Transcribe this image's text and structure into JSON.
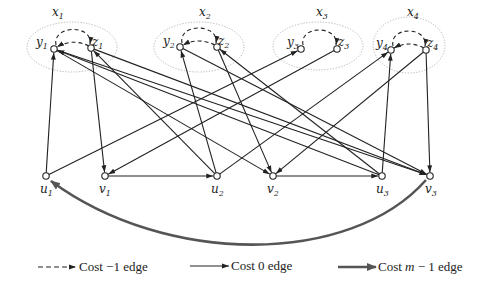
{
  "diagram": {
    "groups": [
      {
        "id": "x1",
        "label": "x",
        "sub": "1",
        "cx": 72,
        "cy": 47,
        "rx": 45,
        "ry": 25,
        "lx": 52,
        "ly": 16
      },
      {
        "id": "x2",
        "label": "x",
        "sub": "2",
        "cx": 199,
        "cy": 47,
        "rx": 45,
        "ry": 25,
        "lx": 199,
        "ly": 16
      },
      {
        "id": "x3",
        "label": "x",
        "sub": "3",
        "cx": 318,
        "cy": 46,
        "rx": 45,
        "ry": 24,
        "lx": 316,
        "ly": 16
      },
      {
        "id": "x4",
        "label": "x",
        "sub": "4",
        "cx": 409,
        "cy": 45,
        "rx": 36,
        "ry": 28,
        "lx": 407,
        "ly": 16
      }
    ],
    "nodes": [
      {
        "id": "y1",
        "label": "y",
        "sub": "1",
        "x": 54,
        "y": 49,
        "lx": 36,
        "ly": 46
      },
      {
        "id": "z1",
        "label": "z",
        "sub": "1",
        "x": 91,
        "y": 48,
        "lx": 92,
        "ly": 46
      },
      {
        "id": "y2",
        "label": "y",
        "sub": "2",
        "x": 180,
        "y": 47,
        "lx": 163,
        "ly": 45
      },
      {
        "id": "z2",
        "label": "z",
        "sub": "2",
        "x": 217,
        "y": 47,
        "lx": 218,
        "ly": 45
      },
      {
        "id": "y3",
        "label": "y",
        "sub": "3",
        "x": 301,
        "y": 49,
        "lx": 287,
        "ly": 46
      },
      {
        "id": "z3",
        "label": "z",
        "sub": "3",
        "x": 337,
        "y": 49,
        "lx": 338,
        "ly": 46
      },
      {
        "id": "y4",
        "label": "y",
        "sub": "4",
        "x": 391,
        "y": 50,
        "lx": 376,
        "ly": 47
      },
      {
        "id": "z4",
        "label": "z",
        "sub": "4",
        "x": 426,
        "y": 50,
        "lx": 427,
        "ly": 47
      },
      {
        "id": "u1",
        "label": "u",
        "sub": "1",
        "x": 46,
        "y": 176,
        "lx": 40,
        "ly": 193
      },
      {
        "id": "v1",
        "label": "v",
        "sub": "1",
        "x": 105,
        "y": 176,
        "lx": 99,
        "ly": 193
      },
      {
        "id": "u2",
        "label": "u",
        "sub": "2",
        "x": 217,
        "y": 176,
        "lx": 211,
        "ly": 193
      },
      {
        "id": "v2",
        "label": "v",
        "sub": "2",
        "x": 273,
        "y": 176,
        "lx": 267,
        "ly": 193
      },
      {
        "id": "u3",
        "label": "u",
        "sub": "3",
        "x": 382,
        "y": 176,
        "lx": 376,
        "ly": 193
      },
      {
        "id": "v3",
        "label": "v",
        "sub": "3",
        "x": 430,
        "y": 176,
        "lx": 425,
        "ly": 193
      }
    ],
    "edges_cost_0": [
      [
        "u1",
        "y1"
      ],
      [
        "u1",
        "y3"
      ],
      [
        "z1",
        "v1"
      ],
      [
        "v1",
        "u2"
      ],
      [
        "u2",
        "y2"
      ],
      [
        "u2",
        "z1"
      ],
      [
        "u2",
        "y4"
      ],
      [
        "z2",
        "v2"
      ],
      [
        "v2",
        "u3"
      ],
      [
        "u3",
        "y4"
      ],
      [
        "u3",
        "y1"
      ],
      [
        "u3",
        "z2"
      ],
      [
        "z4",
        "v3"
      ],
      [
        "z4",
        "v2"
      ],
      [
        "z3",
        "v1"
      ],
      [
        "y1",
        "v3"
      ],
      [
        "z1",
        "v3"
      ],
      [
        "y2",
        "v3"
      ],
      [
        "y1",
        "v2"
      ]
    ],
    "edges_cost_neg1": [
      [
        "y1",
        "z1",
        "upper"
      ],
      [
        "z1",
        "y1",
        "lower"
      ],
      [
        "y2",
        "z2",
        "upper"
      ],
      [
        "z2",
        "y2",
        "lower"
      ],
      [
        "y3",
        "z3",
        "upper"
      ],
      [
        "y4",
        "z4",
        "upper"
      ],
      [
        "z4",
        "y4",
        "lower"
      ]
    ],
    "edges_cost_m1": [
      [
        "v3",
        "u1"
      ]
    ]
  },
  "legend": {
    "items": [
      {
        "label": "Cost −1 edge",
        "style": "dashed"
      },
      {
        "label": "Cost 0 edge",
        "style": "solid"
      },
      {
        "label": "Cost m − 1 edge",
        "style": "thick"
      }
    ]
  },
  "colors": {
    "edge": "#222222",
    "thick_edge": "#555555",
    "group_outline": "#aaaaaa",
    "node_fill": "#ffffff"
  }
}
